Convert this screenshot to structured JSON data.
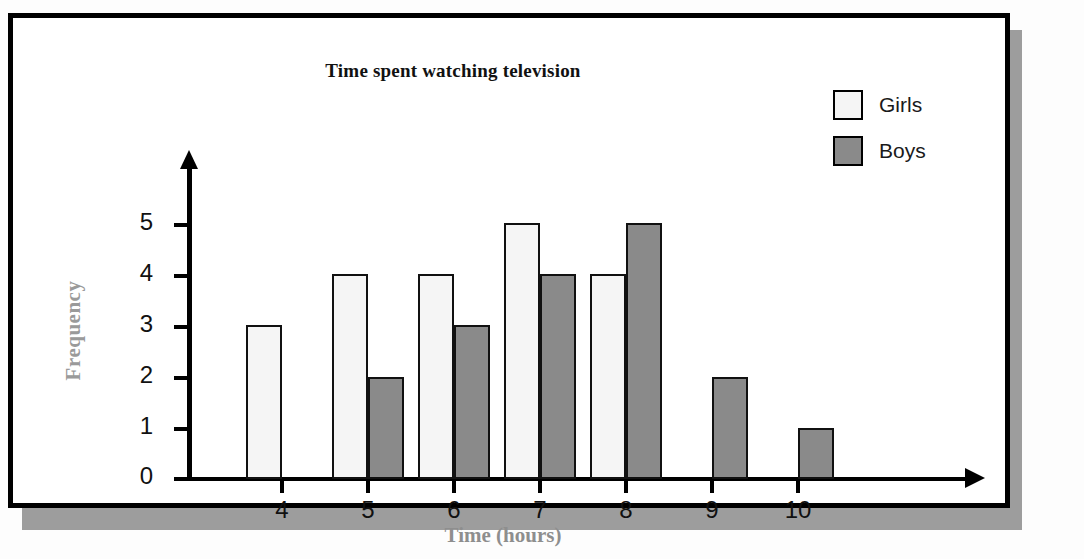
{
  "figure": {
    "title": "Time spent watching television",
    "xlabel": "Time (hours)",
    "ylabel": "Frequency"
  },
  "legend": {
    "position": "top-right",
    "entries": [
      {
        "label": "Girls",
        "color": "#f5f5f5",
        "swatch": "white-square-icon"
      },
      {
        "label": "Boys",
        "color": "#8a8a8a",
        "swatch": "gray-square-icon"
      }
    ]
  },
  "axes": {
    "y_ticks": [
      "5",
      "4",
      "3",
      "2",
      "1",
      "0"
    ],
    "x_ticks": [
      "4",
      "5",
      "6",
      "7",
      "8",
      "9",
      "10"
    ]
  },
  "chart_data": {
    "type": "bar",
    "title": "Time spent watching television",
    "xlabel": "Time (hours)",
    "ylabel": "Frequency",
    "categories": [
      "4",
      "5",
      "6",
      "7",
      "8",
      "9",
      "10"
    ],
    "series": [
      {
        "name": "Girls",
        "color": "#f5f5f5",
        "values": [
          3,
          4,
          4,
          5,
          4,
          0,
          0
        ]
      },
      {
        "name": "Boys",
        "color": "#8a8a8a",
        "values": [
          0,
          2,
          3,
          4,
          5,
          2,
          1
        ]
      }
    ],
    "ylim": [
      0,
      5
    ],
    "yticks": [
      0,
      1,
      2,
      3,
      4,
      5
    ],
    "grid": false,
    "legend_position": "top-right"
  },
  "style": {
    "bar_border": "#111111",
    "axis_color": "#000000",
    "axis_title_color": "#8e8e8e",
    "frame_color": "#000000"
  }
}
